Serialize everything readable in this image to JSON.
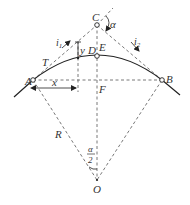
{
  "diagram": {
    "type": "vertical-curve-geometry",
    "colors": {
      "line": "#222222",
      "dashed": "#555555",
      "label": "#333333",
      "background": "#ffffff"
    },
    "points": {
      "A": {
        "label": "A",
        "x": 33,
        "y": 80
      },
      "B": {
        "label": "B",
        "x": 162,
        "y": 80
      },
      "C": {
        "label": "C",
        "x": 97,
        "y": 25
      },
      "D": {
        "label": "D",
        "x": 97,
        "y": 56
      },
      "E": {
        "label": "E",
        "x": 97,
        "y": 45
      },
      "F": {
        "label": "F",
        "x": 97,
        "y": 80
      },
      "O": {
        "label": "O",
        "x": 97,
        "y": 180
      },
      "T": {
        "label": "T",
        "x": 45,
        "y": 63
      }
    },
    "labels": {
      "alpha": "α",
      "alpha_half_num": "α",
      "alpha_half_den": "2",
      "i1": "i",
      "i1_sub": "1",
      "i2": "i",
      "i2_sub": "2",
      "x": "x",
      "y": "y",
      "R": "R"
    }
  }
}
